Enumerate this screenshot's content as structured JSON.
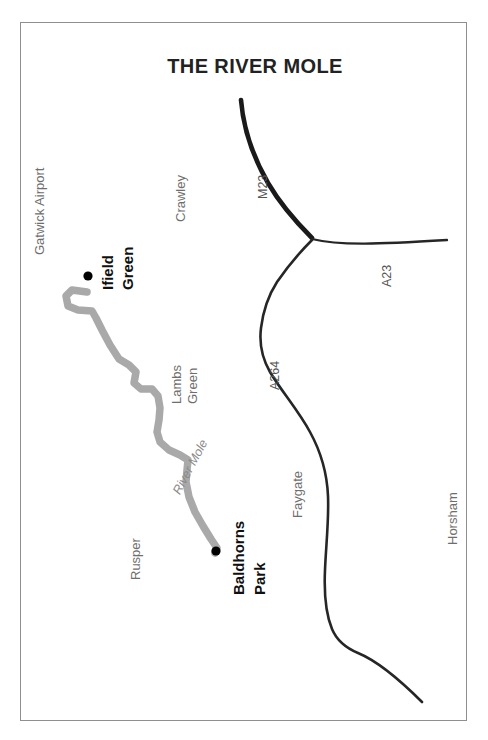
{
  "figure": {
    "title": "THE RIVER MOLE",
    "border_color": "#8f8f8f",
    "background_color": "#ffffff"
  },
  "colors": {
    "river": "#a9a9a9",
    "road_major": "#1a1a1a",
    "road_minor": "#262626",
    "marker": "#000000",
    "label_minor": "#6e6e6e",
    "label_major": "#101010",
    "label_road": "#555555",
    "label_river": "#8a8a8a"
  },
  "places": [
    {
      "name": "Gatwick Airport",
      "style": "minor",
      "lines": [
        "Gatwick Airport"
      ],
      "marker": false
    },
    {
      "name": "Crawley",
      "style": "minor",
      "lines": [
        "Crawley"
      ],
      "marker": false
    },
    {
      "name": "Ifield Green",
      "style": "major",
      "lines": [
        "Ifield",
        "Green"
      ],
      "marker": true
    },
    {
      "name": "Lambs Green",
      "style": "minor",
      "lines": [
        "Lambs",
        "Green"
      ],
      "marker": false
    },
    {
      "name": "Rusper",
      "style": "minor",
      "lines": [
        "Rusper"
      ],
      "marker": false
    },
    {
      "name": "Baldhorns Park",
      "style": "major",
      "lines": [
        "Baldhorns",
        "Park"
      ],
      "marker": true
    },
    {
      "name": "Faygate",
      "style": "minor",
      "lines": [
        "Faygate"
      ],
      "marker": false
    },
    {
      "name": "Horsham",
      "style": "minor",
      "lines": [
        "Horsham"
      ],
      "marker": false
    }
  ],
  "roads": [
    {
      "name": "M23",
      "label": "M23",
      "weight": "major"
    },
    {
      "name": "A23",
      "label": "A23",
      "weight": "minor"
    },
    {
      "name": "A264",
      "label": "A264",
      "weight": "minor"
    }
  ],
  "rivers": [
    {
      "name": "River Mole",
      "label": "River Mole"
    }
  ],
  "labels": {
    "gatwick_airport": "Gatwick Airport",
    "crawley": "Crawley",
    "ifield_line1": "Ifield",
    "ifield_line2": "Green",
    "lambs_line1": "Lambs",
    "lambs_line2": "Green",
    "rusper": "Rusper",
    "baldhorns_line1": "Baldhorns",
    "baldhorns_line2": "Park",
    "faygate": "Faygate",
    "horsham": "Horsham",
    "m23": "M23",
    "a23": "A23",
    "a264": "A264",
    "river_mole": "River Mole"
  }
}
